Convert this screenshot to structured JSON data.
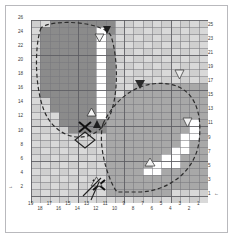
{
  "figure": {
    "title": "",
    "type": "grid-contour-diagram"
  },
  "axes": {
    "bottom": {
      "name": "bottom-axis",
      "direction": "right-to-left",
      "tick_labels": [
        "19",
        "18",
        "17",
        "16",
        "15",
        "14",
        "13",
        "12",
        "11",
        "10",
        "9",
        "8",
        "7",
        "6",
        "5",
        "4",
        "3",
        "2",
        "1"
      ],
      "end_marker": "1"
    },
    "left": {
      "name": "left-axis",
      "tick_labels": [
        "26",
        "24",
        "22",
        "20",
        "18",
        "16",
        "14",
        "12",
        "10",
        "8",
        "6",
        "4",
        "2"
      ],
      "end_marker": "2"
    },
    "right": {
      "name": "right-axis",
      "tick_labels": [
        "25",
        "23",
        "21",
        "19",
        "17",
        "15",
        "13",
        "11",
        "9",
        "7",
        "5",
        "3",
        "1"
      ],
      "end_marker": "1"
    }
  },
  "colors": {
    "background": "#ffffff",
    "plot_background": "#dcdcdc",
    "cell_light": "#cfcfcf",
    "cell_mid": "#a8a8a8",
    "cell_dark": "#8b8b8b",
    "cell_white": "#ffffff",
    "grid_line": "#787880",
    "contour": "#2b2b2b",
    "frame_border": "#b9b9bd",
    "text": "#3a3a3a"
  },
  "markers": [
    {
      "id": "m1",
      "name": "filled-down-triangle-top",
      "shape": "triangle-down",
      "fill": "dark",
      "col": 11,
      "row": 26
    },
    {
      "id": "m2",
      "name": "open-down-triangle-top",
      "shape": "triangle-down",
      "fill": "light",
      "col": 12,
      "row": 25
    },
    {
      "id": "m3",
      "name": "open-up-triangle-left-lobe",
      "shape": "triangle-up",
      "fill": "light",
      "col": 13,
      "row": 13
    },
    {
      "id": "m4",
      "name": "filled-up-triangle-left-lobe",
      "shape": "triangle-up",
      "fill": "dark",
      "col": 12,
      "row": 11
    },
    {
      "id": "m5",
      "name": "x-marker-left-lobe",
      "shape": "x",
      "fill": "dark",
      "col": 13,
      "row": 11
    },
    {
      "id": "m6",
      "name": "diamond-marker-left-lobe",
      "shape": "diamond",
      "fill": "none",
      "col": 13,
      "row": 10
    },
    {
      "id": "m7",
      "name": "filled-down-triangle-right-lobe",
      "shape": "triangle-down",
      "fill": "dark",
      "col": 7,
      "row": 17
    },
    {
      "id": "m8",
      "name": "open-down-triangle-right-top",
      "shape": "triangle-down",
      "fill": "light",
      "col": 3,
      "row": 18
    },
    {
      "id": "m9",
      "name": "open-down-triangle-right-side",
      "shape": "triangle-down",
      "fill": "light",
      "col": 2,
      "row": 12
    },
    {
      "id": "m10",
      "name": "open-up-triangle-right-lobe",
      "shape": "triangle-up",
      "fill": "light",
      "col": 5,
      "row": 6
    },
    {
      "id": "m11",
      "name": "x-marker-bottom",
      "shape": "x",
      "fill": "dark",
      "col": 12,
      "row": 2
    },
    {
      "id": "m12",
      "name": "open-up-triangle-bottom",
      "shape": "triangle-up",
      "fill": "light",
      "col": 12,
      "row": 3
    }
  ],
  "regions": [
    {
      "name": "upper-left-lobe",
      "style": "dashed-contour",
      "shade": "dark"
    },
    {
      "name": "lower-right-lobe",
      "style": "dashed-contour",
      "shade": "mid"
    }
  ],
  "chart_data": {
    "type": "heatmap",
    "title": "",
    "xlabel": "",
    "ylabel": "",
    "xlim": [
      19,
      1
    ],
    "ylim": [
      1,
      26
    ],
    "grid": true,
    "legend": "none",
    "x_ticks": [
      "19",
      "18",
      "17",
      "16",
      "15",
      "14",
      "13",
      "12",
      "11",
      "10",
      "9",
      "8",
      "7",
      "6",
      "5",
      "4",
      "3",
      "2",
      "1"
    ],
    "y_ticks_left": [
      "26",
      "24",
      "22",
      "20",
      "18",
      "16",
      "14",
      "12",
      "10",
      "8",
      "6",
      "4",
      "2"
    ],
    "y_ticks_right": [
      "25",
      "23",
      "21",
      "19",
      "17",
      "15",
      "13",
      "11",
      "9",
      "7",
      "5",
      "3",
      "1"
    ]
  }
}
